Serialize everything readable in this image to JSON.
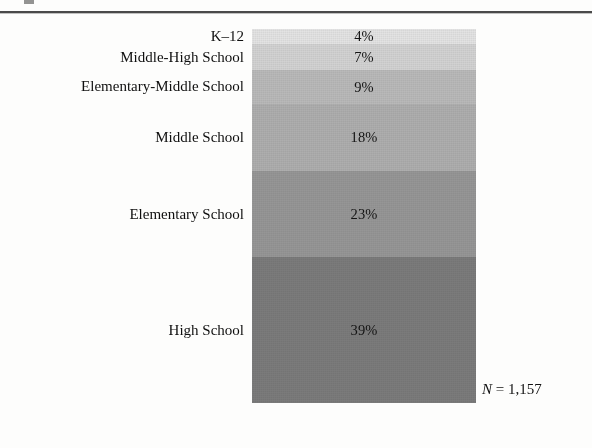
{
  "figure": {
    "n_note_symbol": "N",
    "n_note_equals": " = ",
    "n_note_value": "1,157",
    "n_note_full": "N = 1,157"
  },
  "chart_data": {
    "type": "bar",
    "subtype": "stacked-single-bar",
    "title": "",
    "xlabel": "",
    "ylabel": "",
    "grid": false,
    "legend": "none",
    "total_n": 1157,
    "categories": [
      "K–12",
      "Middle-High School",
      "Elementary-Middle School",
      "Middle School",
      "Elementary School",
      "High School"
    ],
    "values": [
      4,
      7,
      9,
      18,
      23,
      39
    ],
    "value_labels": [
      "4%",
      "7%",
      "9%",
      "18%",
      "23%",
      "39%"
    ],
    "units": "percent",
    "ylim": [
      0,
      100
    ],
    "segment_colors": [
      "#e3e3e3",
      "#d2d2d2",
      "#b9b9b9",
      "#aeaeae",
      "#969696",
      "#7b7b7b"
    ],
    "segments": [
      {
        "label": "K–12",
        "value": 4,
        "value_label": "4%",
        "color": "#e3e3e3"
      },
      {
        "label": "Middle-High School",
        "value": 7,
        "value_label": "7%",
        "color": "#d2d2d2"
      },
      {
        "label": "Elementary-Middle School",
        "value": 9,
        "value_label": "9%",
        "color": "#b9b9b9"
      },
      {
        "label": "Middle School",
        "value": 18,
        "value_label": "18%",
        "color": "#aeaeae"
      },
      {
        "label": "Elementary School",
        "value": 23,
        "value_label": "23%",
        "color": "#969696"
      },
      {
        "label": "High School",
        "value": 39,
        "value_label": "39%",
        "color": "#7b7b7b"
      }
    ]
  }
}
